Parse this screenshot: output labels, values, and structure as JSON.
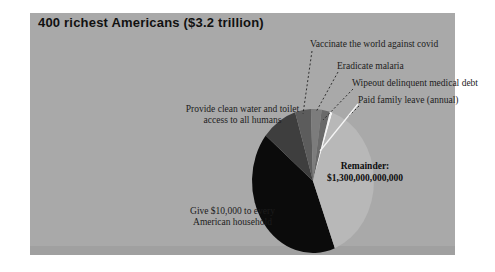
{
  "page": {
    "title": "400 richest Americans ($3.2 trillion)"
  },
  "chart_data": {
    "type": "pie",
    "title": "400 richest Americans ($3.2 trillion)",
    "total_label": "$3.2 trillion",
    "legend_position": "none",
    "background_color": "#a9a9a9",
    "slices": [
      {
        "id": "give-10k",
        "label": "Give $10,000 to every American household",
        "approx_pct": 41.7,
        "color": "#0b0b0b"
      },
      {
        "id": "clean-water",
        "label": "Provide clean water and toilet access to all humans",
        "approx_pct": 9.4,
        "color": "#3e3e3e"
      },
      {
        "id": "vaccinate-covid",
        "label": "Vaccinate the world against covid",
        "approx_pct": 4.2,
        "color": "#5c5c5c"
      },
      {
        "id": "eradicate-malaria",
        "label": "Eradicate malaria",
        "approx_pct": 2.8,
        "color": "#7c7c7c"
      },
      {
        "id": "medical-debt",
        "label": "Wipeout delinquent medical debt",
        "approx_pct": 2.2,
        "color": "#6a6a6a"
      },
      {
        "id": "family-leave",
        "label": "Paid family leave (annual)",
        "approx_pct": 0.7,
        "color": "#f5f5f5"
      },
      {
        "id": "remainder",
        "label": "Remainder: $1,300,000,000,000",
        "approx_pct": 39.0,
        "color": "#b8b8b8",
        "value_shown": "$1,300,000,000,000"
      }
    ]
  },
  "labels": {
    "vaccinate": "Vaccinate the world against covid",
    "malaria": "Eradicate malaria",
    "medical_debt": "Wipeout delinquent medical debt",
    "family_leave": "Paid family leave (annual)",
    "clean_water_line1": "Provide clean water and toilet",
    "clean_water_line2": "access to all humans",
    "give10k_line1": "Give $10,000 to every",
    "give10k_line2": "American household",
    "remainder_line1": "Remainder:",
    "remainder_line2": "$1,300,000,000,000"
  }
}
